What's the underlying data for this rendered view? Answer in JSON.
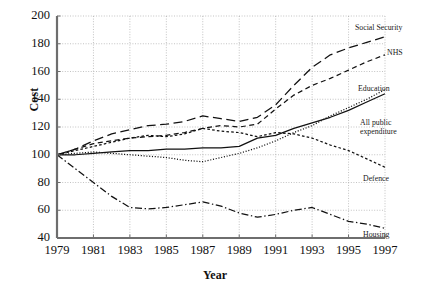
{
  "chart_data": {
    "type": "line",
    "title": "",
    "xlabel": "Year",
    "ylabel": "Cost",
    "xlim": [
      1979,
      1997
    ],
    "ylim": [
      40,
      200
    ],
    "ytick_values": [
      40,
      60,
      80,
      100,
      120,
      140,
      160,
      180,
      200
    ],
    "xtick_values": [
      1979,
      1981,
      1983,
      1985,
      1987,
      1989,
      1991,
      1993,
      1995,
      1997
    ],
    "grid": true,
    "legend_position": "inline-right",
    "x": [
      1979,
      1980,
      1981,
      1982,
      1983,
      1984,
      1985,
      1986,
      1987,
      1988,
      1989,
      1990,
      1991,
      1992,
      1993,
      1994,
      1995,
      1996,
      1997
    ],
    "series": [
      {
        "name": "Social Security",
        "style": "long-dash",
        "values": [
          100,
          104,
          110,
          115,
          118,
          121,
          122,
          124,
          128,
          126,
          124,
          127,
          136,
          150,
          163,
          172,
          177,
          181,
          185
        ]
      },
      {
        "name": "NHS",
        "style": "short-dash",
        "values": [
          100,
          104,
          108,
          110,
          112,
          113,
          114,
          116,
          119,
          121,
          120,
          122,
          133,
          143,
          150,
          155,
          161,
          167,
          172
        ]
      },
      {
        "name": "Education",
        "style": "dotted",
        "values": [
          100,
          101,
          102,
          101,
          100,
          99,
          98,
          96,
          95,
          98,
          101,
          105,
          110,
          116,
          121,
          128,
          134,
          140,
          147
        ]
      },
      {
        "name": "All public expenditure",
        "style": "solid",
        "values": [
          100,
          100,
          101,
          102,
          103,
          103,
          104,
          104,
          105,
          105,
          106,
          112,
          114,
          119,
          123,
          127,
          132,
          138,
          144
        ]
      },
      {
        "name": "Defence",
        "style": "fine-dash",
        "values": [
          100,
          103,
          106,
          109,
          112,
          114,
          113,
          115,
          119,
          117,
          116,
          113,
          116,
          115,
          112,
          107,
          103,
          97,
          91
        ]
      },
      {
        "name": "Housing",
        "style": "dash-dot",
        "values": [
          100,
          90,
          80,
          70,
          62,
          61,
          62,
          64,
          66,
          63,
          58,
          55,
          57,
          60,
          62,
          57,
          52,
          50,
          47
        ]
      }
    ],
    "annotations": [
      {
        "text": "Social Security",
        "series": "Social Security"
      },
      {
        "text": "NHS",
        "series": "NHS"
      },
      {
        "text": "Education",
        "series": "Education"
      },
      {
        "text": "All public\nexpenditure",
        "series": "All public expenditure"
      },
      {
        "text": "Defence",
        "series": "Defence"
      },
      {
        "text": "Housing",
        "series": "Housing"
      }
    ]
  },
  "axes": {
    "y_title": "Cost",
    "x_title": "Year",
    "yticks": [
      "200",
      "180",
      "160",
      "140",
      "120",
      "100",
      "80",
      "60",
      "40"
    ],
    "xticks": [
      "1979",
      "1981",
      "1983",
      "1985",
      "1987",
      "1989",
      "1991",
      "1993",
      "1995",
      "1997"
    ]
  },
  "labels": {
    "social_security": "Social Security",
    "nhs": "NHS",
    "education": "Education",
    "all_public_1": "All public",
    "all_public_2": "expenditure",
    "defence": "Defence",
    "housing": "Housing"
  },
  "colors": {
    "line": "#111111",
    "grid": "#9a9a9a",
    "axis": "#6e6e6e",
    "background": "#ffffff"
  }
}
